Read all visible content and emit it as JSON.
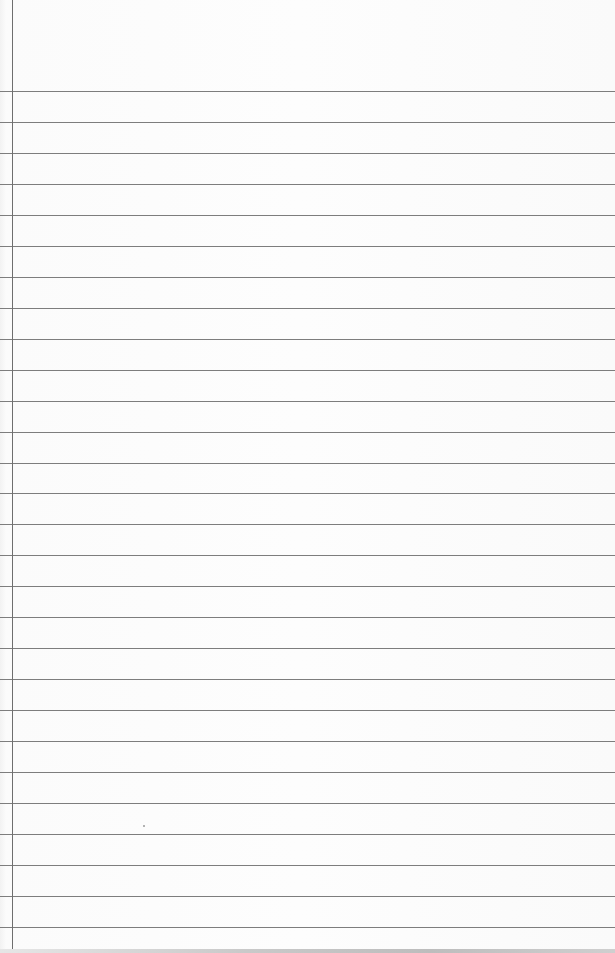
{
  "page": {
    "type": "blank ruled notebook paper",
    "colors": {
      "paper": "#fbfbfb",
      "rule_line": "#7d7d7d",
      "margin_line": "#6e6e6e"
    },
    "rule_count": 28,
    "first_rule_y": 91,
    "rule_spacing": 30.96,
    "margin_x": 12
  }
}
